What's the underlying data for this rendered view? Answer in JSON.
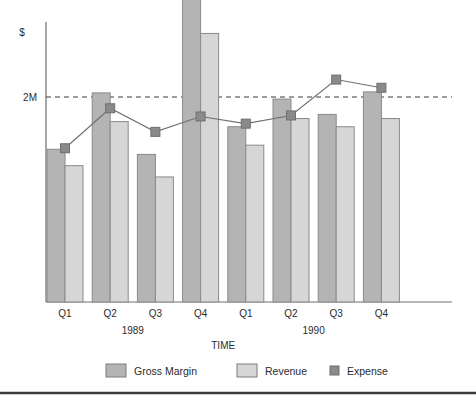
{
  "chart_data": {
    "type": "bar",
    "title": "",
    "subtitle": "",
    "xlabel": "TIME",
    "ylabel": "$",
    "categories": [
      "Q1",
      "Q2",
      "Q3",
      "Q4",
      "Q1",
      "Q2",
      "Q3",
      "Q4"
    ],
    "group_labels": [
      "1989",
      "1990"
    ],
    "y_ticks": [
      {
        "label": "2M",
        "value": 2.0
      }
    ],
    "ylim": [
      0,
      3.2
    ],
    "grid": false,
    "reference_line": {
      "label": "2M",
      "value": 2.0,
      "style": "dashed"
    },
    "legend_position": "bottom",
    "series": [
      {
        "name": "Gross Margin",
        "type": "bar",
        "color": "#b4b4b4",
        "values": [
          1.49,
          2.04,
          1.44,
          3.0,
          1.71,
          1.98,
          1.83,
          2.05
        ]
      },
      {
        "name": "Revenue",
        "type": "bar",
        "color": "#d6d6d6",
        "values": [
          1.33,
          1.76,
          1.22,
          2.62,
          1.53,
          1.79,
          1.71,
          1.79
        ]
      },
      {
        "name": "Expense",
        "type": "line-marker",
        "color": "#8a8a8a",
        "values": [
          1.5,
          1.89,
          1.66,
          1.81,
          1.74,
          1.82,
          2.17,
          2.09
        ]
      }
    ]
  },
  "axes": {
    "y_axis_label": "$",
    "y_tick_label": "2M",
    "x_axis_label": "TIME",
    "quarter_labels": [
      "Q1",
      "Q2",
      "Q3",
      "Q4",
      "Q1",
      "Q2",
      "Q3",
      "Q4"
    ],
    "year_label_1": "1989",
    "year_label_2": "1990"
  },
  "legend": {
    "items": [
      {
        "label": "Gross Margin",
        "swatch": "bar",
        "color": "#b4b4b4"
      },
      {
        "label": "Revenue",
        "swatch": "bar",
        "color": "#d6d6d6"
      },
      {
        "label": "Expense",
        "swatch": "marker",
        "color": "#8a8a8a"
      }
    ]
  },
  "colors": {
    "gross_margin": "#b4b4b4",
    "revenue": "#d6d6d6",
    "expense": "#8a8a8a",
    "axis": "#6e6e6e",
    "bar_outline": "#8a8a8a",
    "text": "#2b2b2b",
    "footer_rule": "#3a3a3a",
    "background": "#ffffff"
  }
}
